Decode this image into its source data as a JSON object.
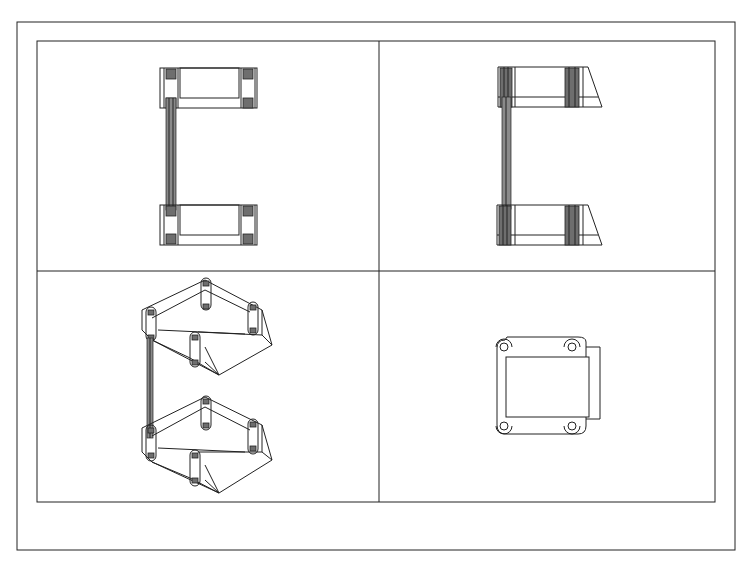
{
  "drawing": {
    "type": "multi-view engineering drawing",
    "colors": {
      "background": "#ffffff",
      "line": "#222222",
      "hatch": "#6e6e6e"
    },
    "outer_border": {
      "x": 17,
      "y": 22,
      "w": 718,
      "h": 528
    },
    "inner_frame": {
      "x": 37,
      "y": 41,
      "w": 678,
      "h": 461
    },
    "divider_vertical_x": 379,
    "divider_horizontal_y": 271,
    "viewports": [
      {
        "id": "top-left",
        "label": "front-view"
      },
      {
        "id": "top-right",
        "label": "side-view"
      },
      {
        "id": "bottom-left",
        "label": "isometric-view"
      },
      {
        "id": "bottom-right",
        "label": "top-view"
      }
    ]
  }
}
